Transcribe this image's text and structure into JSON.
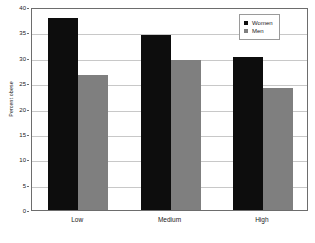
{
  "chart_data": {
    "type": "bar",
    "title": "",
    "subtitle": "",
    "xlabel": "",
    "ylabel": "Percent obese",
    "categories": [
      "Low",
      "Medium",
      "High"
    ],
    "series": [
      {
        "name": "Women",
        "color": "#0d0d0d",
        "values": [
          37.8,
          34.5,
          30.1
        ]
      },
      {
        "name": "Men",
        "color": "#7f7f7f",
        "values": [
          26.7,
          29.5,
          24.0
        ]
      }
    ],
    "ylim": [
      0,
      40
    ],
    "yticks": [
      0,
      5,
      10,
      15,
      20,
      25,
      30,
      35,
      40
    ],
    "ytick_labels": [
      "0",
      "5",
      "10",
      "15",
      "20",
      "25",
      "30",
      "35",
      "40"
    ],
    "grid": true,
    "grid_axis": "y",
    "legend_position": "top-right",
    "legend_entries": [
      "Women",
      "Men"
    ],
    "plot_background": "#ffffff",
    "grid_color": "#c8c8c8",
    "axis_color": "#6d6d6d"
  }
}
